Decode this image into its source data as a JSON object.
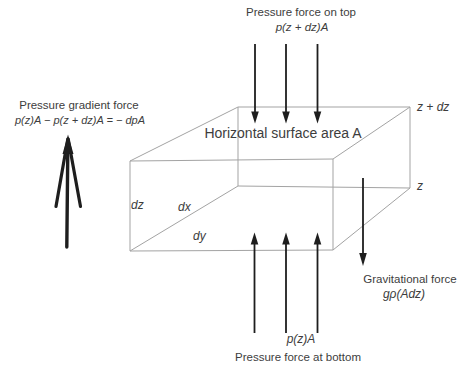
{
  "diagram": {
    "labels": {
      "top_force_label": "Pressure force on top",
      "top_force_formula": "p(z + dz)A",
      "gradient_label": "Pressure gradient force",
      "gradient_formula": "p(z)A − p(z + dz)A = − dpA",
      "surface_label": "Horizontal surface area A",
      "z_plus_dz": "z + dz",
      "z": "z",
      "dz": "dz",
      "dx": "dx",
      "dy": "dy",
      "gravity_label": "Gravitational force",
      "gravity_formula": "gρ(Adz)",
      "bottom_force_formula": "p(z)A",
      "bottom_force_label": "Pressure force at bottom"
    },
    "colors": {
      "background": "#ffffff",
      "text": "#3d3d3d",
      "box_line": "#a3a3a3",
      "arrow": "#1e1e1e"
    }
  }
}
